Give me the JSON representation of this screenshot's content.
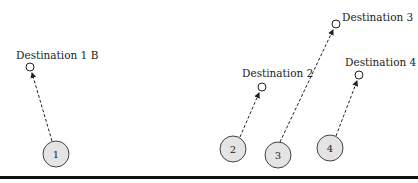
{
  "diagram": {
    "baseline": {
      "y": 178,
      "color": "#111111"
    },
    "agents": [
      {
        "id": "1",
        "label": "1",
        "cx": 56,
        "cy": 154,
        "r": 13,
        "fill": "#e4e4e4"
      },
      {
        "id": "2",
        "label": "2",
        "cx": 233,
        "cy": 149,
        "r": 13,
        "fill": "#e4e4e4"
      },
      {
        "id": "3",
        "label": "3",
        "cx": 278,
        "cy": 155,
        "r": 13,
        "fill": "#e4e4e4"
      },
      {
        "id": "4",
        "label": "4",
        "cx": 330,
        "cy": 148,
        "r": 13,
        "fill": "#e4e4e4"
      }
    ],
    "destinations": [
      {
        "id": "1b",
        "label": "Destination 1 B",
        "cx": 30,
        "cy": 67,
        "label_x": 16,
        "label_y": 59
      },
      {
        "id": "2",
        "label": "Destination 2",
        "cx": 262,
        "cy": 87,
        "label_x": 242,
        "label_y": 77
      },
      {
        "id": "3",
        "label": "Destination 3",
        "cx": 336,
        "cy": 24,
        "label_x": 342,
        "label_y": 21
      },
      {
        "id": "4",
        "label": "Destination 4",
        "cx": 359,
        "cy": 75,
        "label_x": 345,
        "label_y": 66
      }
    ]
  }
}
